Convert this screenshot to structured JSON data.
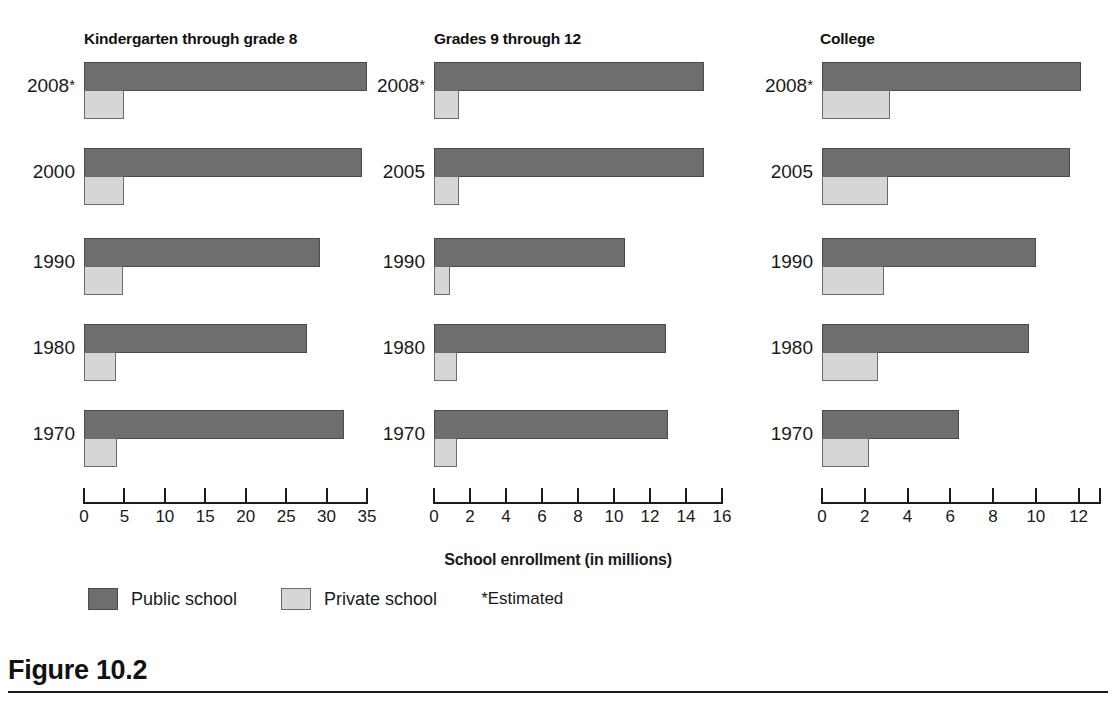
{
  "figure": {
    "caption": "Figure 10.2",
    "axis_title": "School enrollment (in millions)",
    "legend": {
      "public_label": "Public school",
      "private_label": "Private school",
      "note": "*Estimated"
    },
    "colors": {
      "public": "#6e6e6e",
      "private": "#d6d6d6",
      "outline": "#4a4a4a",
      "text": "#1a1a1a",
      "background": "#ffffff"
    }
  },
  "chart_data": {
    "type": "bar",
    "title": "Figure 10.2",
    "xlabel": "School enrollment (in millions)",
    "ylabel": "",
    "orientation": "horizontal",
    "grid": false,
    "legend_position": "bottom-left",
    "series_names": [
      "Public school",
      "Private school"
    ],
    "note": "*Estimated",
    "panels": [
      {
        "title": "Kindergarten through grade 8",
        "categories": [
          "2008*",
          "2000",
          "1990",
          "1980",
          "1970"
        ],
        "xlim": [
          0,
          35
        ],
        "xticks": [
          0,
          5,
          10,
          15,
          20,
          25,
          30,
          35
        ],
        "xticklabels": [
          "0",
          "5",
          "10",
          "15",
          "20",
          "25",
          "30",
          "35"
        ],
        "series": [
          {
            "name": "Public school",
            "values": [
              35.0,
              34.4,
              29.2,
              27.6,
              32.2
            ]
          },
          {
            "name": "Private school",
            "values": [
              4.9,
              4.9,
              4.8,
              4.0,
              4.1
            ]
          }
        ]
      },
      {
        "title": "Grades 9 through 12",
        "categories": [
          "2008*",
          "2005",
          "1990",
          "1980",
          "1970"
        ],
        "xlim": [
          0,
          16
        ],
        "xticks": [
          0,
          2,
          4,
          6,
          8,
          10,
          12,
          14,
          16
        ],
        "xticklabels": [
          "0",
          "2",
          "4",
          "6",
          "8",
          "10",
          "12",
          "14",
          "16"
        ],
        "series": [
          {
            "name": "Public school",
            "values": [
              15.0,
              15.0,
              10.6,
              12.9,
              13.0
            ]
          },
          {
            "name": "Private school",
            "values": [
              1.4,
              1.4,
              0.9,
              1.3,
              1.3
            ]
          }
        ]
      },
      {
        "title": "College",
        "categories": [
          "2008*",
          "2005",
          "1990",
          "1980",
          "1970"
        ],
        "xlim": [
          0,
          13
        ],
        "xticks": [
          0,
          2,
          4,
          6,
          8,
          10,
          12,
          13
        ],
        "xticklabels": [
          "0",
          "2",
          "4",
          "6",
          "8",
          "10",
          "12",
          ""
        ],
        "series": [
          {
            "name": "Public school",
            "values": [
              12.1,
              11.6,
              10.0,
              9.7,
              6.4
            ]
          },
          {
            "name": "Private school",
            "values": [
              3.2,
              3.1,
              2.9,
              2.6,
              2.2
            ]
          }
        ]
      }
    ]
  }
}
